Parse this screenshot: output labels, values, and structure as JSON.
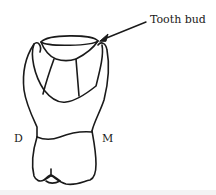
{
  "figure": {
    "labels": {
      "tooth_bud": "Tooth bud",
      "distal": "D",
      "mesial": "M"
    },
    "colors": {
      "stroke": "#1a1a1a",
      "background": "#ffffff"
    }
  }
}
